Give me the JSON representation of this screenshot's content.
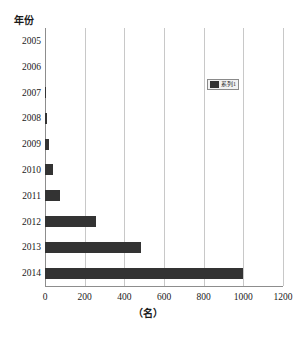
{
  "chart_data": {
    "type": "bar",
    "orientation": "horizontal",
    "title": "",
    "xlabel": "（名）",
    "ylabel": "年份",
    "categories": [
      "2005",
      "2006",
      "2007",
      "2008",
      "2009",
      "2010",
      "2011",
      "2012",
      "2013",
      "2014"
    ],
    "values": [
      0,
      0,
      3,
      8,
      20,
      42,
      75,
      258,
      485,
      1000
    ],
    "xlim": [
      0,
      1200
    ],
    "xticks": [
      0,
      200,
      400,
      600,
      800,
      1000,
      1200
    ],
    "xtick_labels": [
      "0",
      "200",
      "400",
      "600",
      "800",
      "1000",
      "1200"
    ],
    "grid": "vertical",
    "series": [
      {
        "name": "系列1",
        "values": [
          0,
          0,
          3,
          8,
          20,
          42,
          75,
          258,
          485,
          1000
        ]
      }
    ],
    "legend": {
      "position": "top-right",
      "entries": [
        "系列1"
      ]
    },
    "colors": {
      "bar": "#333333",
      "gridline": "#c8c8c8",
      "axis": "#8d8d8d",
      "background": "#ffffff",
      "text": "#1a1a1a"
    }
  }
}
